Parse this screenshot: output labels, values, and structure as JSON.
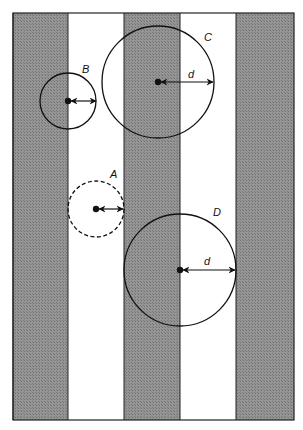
{
  "diagram": {
    "frame": {
      "x": 13,
      "y": 13,
      "width": 281,
      "height": 407
    },
    "colors": {
      "stripe_dark": "#8a8a8a",
      "stripe_light": "#ffffff",
      "line": "#111111",
      "background": "#ffffff"
    },
    "stripes": [
      {
        "x": 13,
        "width": 55,
        "shade": "dark"
      },
      {
        "x": 68,
        "width": 56,
        "shade": "light"
      },
      {
        "x": 124,
        "width": 56,
        "shade": "dark"
      },
      {
        "x": 180,
        "width": 56,
        "shade": "light"
      },
      {
        "x": 236,
        "width": 58,
        "shade": "dark"
      }
    ],
    "circles": [
      {
        "id": "A",
        "label": "A",
        "cx": 96,
        "cy": 209,
        "r": 28,
        "dashed": true,
        "label_x": 110,
        "label_y": 178,
        "arrow_to_x": 123
      },
      {
        "id": "B",
        "label": "B",
        "cx": 68,
        "cy": 101,
        "r": 28,
        "dashed": false,
        "label_x": 82,
        "label_y": 73,
        "arrow_to_x": 96
      },
      {
        "id": "C",
        "label": "C",
        "cx": 158,
        "cy": 82,
        "r": 56,
        "dashed": false,
        "label_x": 204,
        "label_y": 41,
        "arrow_to_x": 213,
        "distance_label": "d",
        "distance_label_x": 188,
        "distance_label_y": 78
      },
      {
        "id": "D",
        "label": "D",
        "cx": 180,
        "cy": 270,
        "r": 56,
        "dashed": false,
        "label_x": 213,
        "label_y": 216,
        "arrow_to_x": 235,
        "distance_label": "d",
        "distance_label_x": 204,
        "distance_label_y": 265
      }
    ]
  }
}
